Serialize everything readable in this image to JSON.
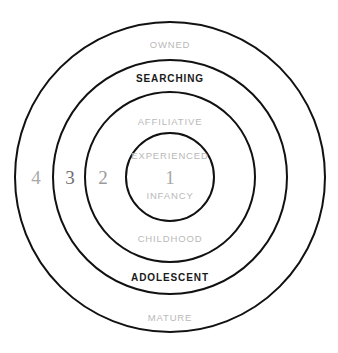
{
  "diagram": {
    "type": "concentric-circles",
    "background_color": "#ffffff",
    "stroke_color": "#111111",
    "center": {
      "x": 170,
      "y": 177
    },
    "soft_text_color": "#b9b9b9",
    "strong_text_color": "#1a1a1a",
    "rings": [
      {
        "number": "4",
        "radius": 155,
        "number_x": 36,
        "number_y": 177
      },
      {
        "number": "3",
        "radius": 117,
        "number_x": 70,
        "number_y": 177
      },
      {
        "number": "2",
        "radius": 85,
        "number_x": 103,
        "number_y": 177
      },
      {
        "number": "1",
        "radius": 44,
        "number_x": 170,
        "number_y": 177
      }
    ],
    "labels": [
      {
        "text": "OWNED",
        "x": 170,
        "y": 45,
        "emphasis": "soft"
      },
      {
        "text": "SEARCHING",
        "x": 170,
        "y": 79,
        "emphasis": "strong"
      },
      {
        "text": "AFFILIATIVE",
        "x": 170,
        "y": 122,
        "emphasis": "soft"
      },
      {
        "text": "EXPERIENCED",
        "x": 170,
        "y": 156,
        "emphasis": "soft"
      },
      {
        "text": "INFANCY",
        "x": 170,
        "y": 196,
        "emphasis": "soft"
      },
      {
        "text": "CHILDHOOD",
        "x": 170,
        "y": 239,
        "emphasis": "soft"
      },
      {
        "text": "ADOLESCENT",
        "x": 170,
        "y": 278,
        "emphasis": "strong"
      },
      {
        "text": "MATURE",
        "x": 170,
        "y": 318,
        "emphasis": "soft"
      }
    ]
  }
}
